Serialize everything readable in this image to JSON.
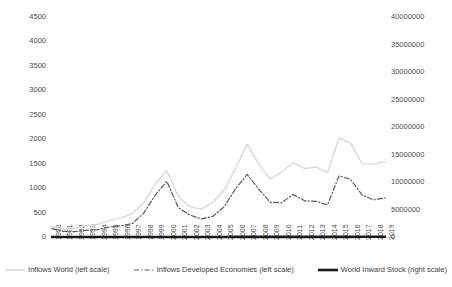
{
  "chart_data": {
    "type": "line",
    "title": "",
    "subtitle": "",
    "xlabel": "",
    "ylabel": "",
    "grid": false,
    "legend_position": "bottom",
    "categories": [
      "1990",
      "1991",
      "1992",
      "1993",
      "1994",
      "1995",
      "1996",
      "1997",
      "1998",
      "1999",
      "2000",
      "2001",
      "2002",
      "2003",
      "2004",
      "2005",
      "2006",
      "2007",
      "2008",
      "2009",
      "2010",
      "2011",
      "2012",
      "2013",
      "2014",
      "2015",
      "2016",
      "2017",
      "2018",
      "2019"
    ],
    "axes": {
      "left": {
        "label": "",
        "ylim": [
          0,
          4500
        ],
        "ticks": [
          0,
          500,
          1000,
          1500,
          2000,
          2500,
          3000,
          3500,
          4000,
          4500
        ],
        "tick_labels": [
          "0",
          "500",
          "1000",
          "1500",
          "2000",
          "2500",
          "3000",
          "3500",
          "4000",
          "4500"
        ]
      },
      "right": {
        "label": "",
        "ylim": [
          0,
          40000000
        ],
        "ticks": [
          0,
          5000000,
          10000000,
          15000000,
          20000000,
          25000000,
          30000000,
          35000000,
          40000000
        ],
        "tick_labels": [
          "0",
          "5000000",
          "10000000",
          "15000000",
          "20000000",
          "25000000",
          "30000000",
          "35000000",
          "40000000"
        ]
      }
    },
    "series": [
      {
        "name": "Inflows World (left scale)",
        "axis": "left",
        "style": "solid",
        "color": "#d9d9d9",
        "width": 1.4,
        "values": [
          210,
          160,
          175,
          230,
          260,
          340,
          390,
          480,
          700,
          1090,
          1360,
          830,
          620,
          570,
          710,
          960,
          1410,
          1900,
          1490,
          1180,
          1330,
          1520,
          1400,
          1430,
          1320,
          2030,
          1920,
          1500,
          1490,
          1540
        ]
      },
      {
        "name": "Inflows Developed Economies (left scale)",
        "axis": "left",
        "style": "dashdot",
        "color": "#5a5a5a",
        "width": 1.2,
        "values": [
          170,
          115,
          110,
          140,
          150,
          205,
          230,
          275,
          490,
          860,
          1140,
          600,
          450,
          370,
          420,
          620,
          990,
          1280,
          980,
          710,
          700,
          870,
          740,
          730,
          660,
          1250,
          1180,
          860,
          760,
          800
        ]
      },
      {
        "name": "World Inward Stock (right scale)",
        "axis": "right",
        "style": "solid",
        "color": "#1a1a1a",
        "width": 2.6,
        "values": [
          2200,
          2300,
          2450,
          2700,
          3000,
          3400,
          3900,
          4600,
          5400,
          6900,
          7450,
          7400,
          7350,
          9100,
          10900,
          11800,
          14800,
          18000,
          15000,
          17500,
          19200,
          20000,
          22000,
          24000,
          25300,
          26700,
          29500,
          33000,
          32800,
          36300
        ]
      }
    ],
    "series_scale_note": {
      "world_inward_stock_units": "thousands"
    }
  },
  "legend": {
    "items": [
      {
        "label": "Inflows World (left scale)",
        "icon": "line-solid-light-icon"
      },
      {
        "label": "Inflows Developed Economies (left scale)",
        "icon": "line-dashdot-icon"
      },
      {
        "label": "World Inward Stock (right scale)",
        "icon": "line-solid-bold-icon"
      }
    ]
  },
  "colors": {
    "series_inflows_world": "#d9d9d9",
    "series_inflows_developed": "#5a5a5a",
    "series_world_inward_stock": "#1a1a1a",
    "text": "#3d3d3d",
    "background": "#ffffff"
  }
}
